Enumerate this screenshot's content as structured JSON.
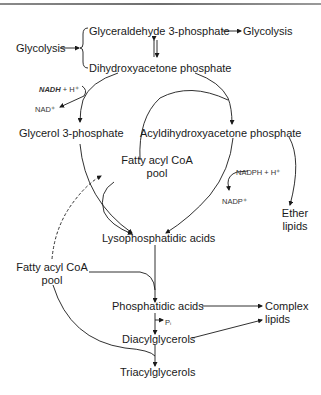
{
  "diagram": {
    "type": "metabolic-pathway",
    "nodes": {
      "glycolysis_in": "Glycolysis",
      "glyceraldehyde_3p": "Glyceraldehyde 3-phosphate",
      "glycolysis_out": "Glycolysis",
      "dhap": "Dihydroxyacetone phosphate",
      "nadh": "NADH",
      "nadh_plus": "+ H⁺",
      "nad": "NAD⁺",
      "glycerol_3p": "Glycerol 3-phosphate",
      "acyl_dhap": "Acyldihydroxyacetone phosphate",
      "fatty_acyl_pool_1_line1": "Fatty acyl CoA",
      "fatty_acyl_pool_1_line2": "pool",
      "nadph": "NADPH + H⁺",
      "nadp": "NADP⁺",
      "ether_lipids_line1": "Ether",
      "ether_lipids_line2": "lipids",
      "lysophosphatidic": "Lysophosphatidic acids",
      "fatty_acyl_pool_2_line1": "Fatty acyl CoA",
      "fatty_acyl_pool_2_line2": "pool",
      "phosphatidic": "Phosphatidic acids",
      "pi": "Pᵢ",
      "complex_lipids_line1": "Complex",
      "complex_lipids_line2": "lipids",
      "diacylglycerols": "Diacylglycerols",
      "triacylglycerols": "Triacylglycerols"
    },
    "edges": [
      {
        "from": "Glycolysis",
        "to": "Glyceraldehyde 3-phosphate / Dihydroxyacetone phosphate"
      },
      {
        "from": "Glyceraldehyde 3-phosphate",
        "to": "Glycolysis"
      },
      {
        "from": "Glyceraldehyde 3-phosphate",
        "to": "Dihydroxyacetone phosphate",
        "bidirectional": true
      },
      {
        "from": "Dihydroxyacetone phosphate",
        "to": "Glycerol 3-phosphate",
        "cofactor_in": "NADH + H⁺",
        "cofactor_out": "NAD⁺"
      },
      {
        "from": "Dihydroxyacetone phosphate",
        "to": "Acyldihydroxyacetone phosphate"
      },
      {
        "from": "Glycerol 3-phosphate",
        "to": "Acyldihydroxyacetone phosphate",
        "via": "Fatty acyl CoA"
      },
      {
        "from": "Glycerol 3-phosphate",
        "to": "Lysophosphatidic acids"
      },
      {
        "from": "Fatty acyl CoA pool",
        "to": "Lysophosphatidic acids"
      },
      {
        "from": "Acyldihydroxyacetone phosphate",
        "to": "Lysophosphatidic acids",
        "cofactor_in": "NADPH + H⁺",
        "cofactor_out": "NADP⁺"
      },
      {
        "from": "Acyldihydroxyacetone phosphate",
        "to": "Ether lipids"
      },
      {
        "from": "Fatty acyl CoA pool (lower)",
        "to": "Fatty acyl CoA pool (upper)",
        "style": "dashed"
      },
      {
        "from": "Lysophosphatidic acids",
        "to": "Phosphatidic acids"
      },
      {
        "from": "Fatty acyl CoA pool (lower)",
        "to": "Phosphatidic acids"
      },
      {
        "from": "Phosphatidic acids",
        "to": "Complex lipids"
      },
      {
        "from": "Phosphatidic acids",
        "to": "Diacylglycerols",
        "byproduct": "Pᵢ"
      },
      {
        "from": "Diacylglycerols",
        "to": "Complex lipids"
      },
      {
        "from": "Diacylglycerols",
        "to": "Triacylglycerols"
      },
      {
        "from": "Fatty acyl CoA pool (lower)",
        "to": "Triacylglycerols"
      }
    ]
  }
}
